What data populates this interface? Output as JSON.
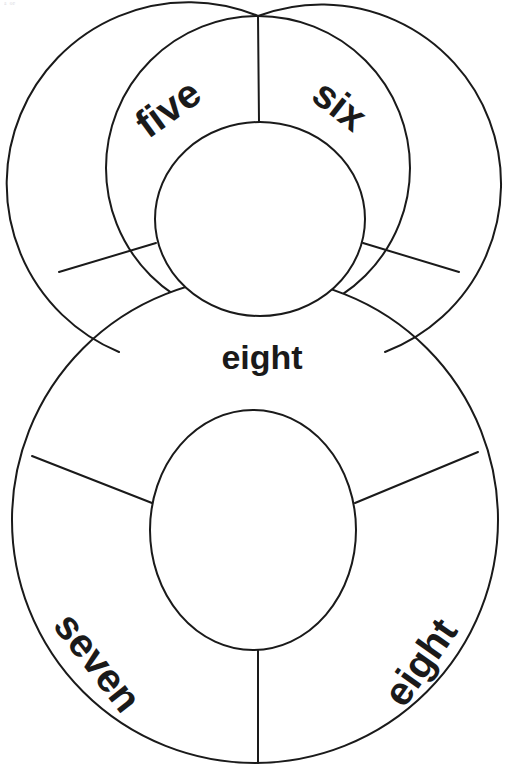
{
  "page": {
    "faint_header_text": "ᵃ  ᵒᵉ",
    "background_color": "#ffffff",
    "stroke_color": "#1a1a1a",
    "text_color": "#1a1a1a",
    "width": 513,
    "height": 780
  },
  "figure": {
    "name": "figure-eight-number-wheel",
    "top_wheel": {
      "name": "top-wheel",
      "outer": {
        "cx": 258,
        "cy": 168,
        "r": 152
      },
      "inner": {
        "cx": 260,
        "cy": 219,
        "rx": 105,
        "ry": 97
      },
      "segments": [
        {
          "id": "top-left",
          "label": "five",
          "rotation": -36,
          "label_x": 168,
          "label_y": 108
        },
        {
          "id": "top-right",
          "label": "six",
          "rotation": 38,
          "label_x": 340,
          "label_y": 105
        }
      ],
      "dividers": [
        {
          "id": "top-divider-vertical",
          "angle": -90
        },
        {
          "id": "top-divider-lower-left",
          "angle": 150
        },
        {
          "id": "top-divider-lower-right",
          "angle": 30
        }
      ]
    },
    "bottom_wheel": {
      "name": "bottom-wheel",
      "outer": {
        "cx": 255,
        "cy": 520,
        "r": 243
      },
      "inner": {
        "cx": 253,
        "cy": 530,
        "rx": 103,
        "ry": 120
      },
      "segments": [
        {
          "id": "bottom-left",
          "label": "seven",
          "rotation": 52,
          "label_x": 98,
          "label_y": 662
        },
        {
          "id": "bottom-right",
          "label": "eight",
          "rotation": -55,
          "label_x": 420,
          "label_y": 662
        }
      ],
      "dividers": [
        {
          "id": "bottom-divider-vertical",
          "angle": 90
        },
        {
          "id": "bottom-divider-upper-left",
          "angle": 208
        },
        {
          "id": "bottom-divider-upper-right",
          "angle": -28
        }
      ]
    },
    "center_label": {
      "id": "center",
      "label": "eight",
      "rotation": 0,
      "label_x": 262,
      "label_y": 357
    }
  },
  "labels": {
    "five": "five",
    "six": "six",
    "center_eight": "eight",
    "seven": "seven",
    "bottom_eight": "eight"
  },
  "font_sizes": {
    "wheel_label": 40,
    "center_label": 34
  }
}
